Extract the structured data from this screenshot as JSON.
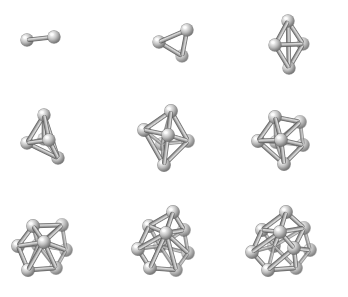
{
  "figure": {
    "background_color": "#ffffff",
    "grid": {
      "rows": 3,
      "cols": 3
    },
    "render_style": "ball-and-stick",
    "atom_color_highlight": "#f2f2f2",
    "atom_color_mid": "#b0b0b0",
    "atom_color_shadow": "#5a5a5a",
    "bond_color_light": "#c8c8c8",
    "bond_color_dark": "#707070",
    "bond_outline_color": "#4f4f4f"
  },
  "clusters": [
    {
      "id": "cluster-n2",
      "label": "N = 2",
      "atom_count": 2,
      "geometry": "dimer",
      "radius": 6.2,
      "atoms": [
        {
          "x": 27,
          "y": 40,
          "z": 0
        },
        {
          "x": 54,
          "y": 37,
          "z": 6
        }
      ],
      "bonds": [
        [
          0,
          1
        ]
      ]
    },
    {
      "id": "cluster-n3",
      "label": "N = 3",
      "atom_count": 3,
      "geometry": "triangle",
      "radius": 6.2,
      "atoms": [
        {
          "x": 43,
          "y": 42,
          "z": 2
        },
        {
          "x": 71,
          "y": 30,
          "z": 8
        },
        {
          "x": 66,
          "y": 56,
          "z": -2
        }
      ],
      "bonds": [
        [
          0,
          1
        ],
        [
          0,
          2
        ],
        [
          1,
          2
        ]
      ]
    },
    {
      "id": "cluster-n4",
      "label": "N = 4",
      "atom_count": 4,
      "geometry": "tetrahedron",
      "radius": 6.2,
      "atoms": [
        {
          "x": 56,
          "y": 21,
          "z": 4
        },
        {
          "x": 43,
          "y": 45,
          "z": 10
        },
        {
          "x": 71,
          "y": 44,
          "z": -2
        },
        {
          "x": 57,
          "y": 68,
          "z": 2
        }
      ],
      "bonds": [
        [
          0,
          1
        ],
        [
          0,
          2
        ],
        [
          1,
          2
        ],
        [
          1,
          3
        ],
        [
          2,
          3
        ],
        [
          0,
          3
        ]
      ]
    },
    {
      "id": "cluster-n5",
      "label": "N = 5",
      "atom_count": 5,
      "geometry": "trigonal-bipyramid",
      "radius": 6.2,
      "atoms": [
        {
          "x": 44,
          "y": 16,
          "z": 6
        },
        {
          "x": 27,
          "y": 44,
          "z": 2
        },
        {
          "x": 49,
          "y": 41,
          "z": 10
        },
        {
          "x": 58,
          "y": 59,
          "z": 0
        },
        {
          "x": 44,
          "y": 40,
          "z": -8
        }
      ],
      "bonds": [
        [
          0,
          1
        ],
        [
          0,
          2
        ],
        [
          0,
          4
        ],
        [
          1,
          2
        ],
        [
          1,
          4
        ],
        [
          2,
          3
        ],
        [
          2,
          4
        ],
        [
          3,
          4
        ],
        [
          0,
          3
        ],
        [
          1,
          3
        ]
      ]
    },
    {
      "id": "cluster-n6",
      "label": "N = 6",
      "atom_count": 6,
      "geometry": "octahedron",
      "radius": 6.4,
      "atoms": [
        {
          "x": 55,
          "y": 12,
          "z": 4
        },
        {
          "x": 28,
          "y": 31,
          "z": 2
        },
        {
          "x": 52,
          "y": 36,
          "z": 12
        },
        {
          "x": 72,
          "y": 42,
          "z": -2
        },
        {
          "x": 46,
          "y": 45,
          "z": -10
        },
        {
          "x": 48,
          "y": 66,
          "z": 2
        }
      ],
      "bonds": [
        [
          0,
          1
        ],
        [
          0,
          2
        ],
        [
          0,
          3
        ],
        [
          0,
          4
        ],
        [
          1,
          2
        ],
        [
          1,
          4
        ],
        [
          1,
          5
        ],
        [
          2,
          3
        ],
        [
          2,
          5
        ],
        [
          3,
          4
        ],
        [
          3,
          5
        ],
        [
          4,
          5
        ]
      ]
    },
    {
      "id": "cluster-n7",
      "label": "N = 7",
      "atom_count": 7,
      "geometry": "pentagonal-bipyramid",
      "radius": 6.4,
      "atoms": [
        {
          "x": 43,
          "y": 18,
          "z": 4
        },
        {
          "x": 68,
          "y": 23,
          "z": -2
        },
        {
          "x": 26,
          "y": 42,
          "z": 2
        },
        {
          "x": 49,
          "y": 41,
          "z": 12
        },
        {
          "x": 71,
          "y": 46,
          "z": -4
        },
        {
          "x": 44,
          "y": 43,
          "z": -12
        },
        {
          "x": 52,
          "y": 65,
          "z": 2
        }
      ],
      "bonds": [
        [
          0,
          1
        ],
        [
          0,
          2
        ],
        [
          0,
          3
        ],
        [
          0,
          5
        ],
        [
          1,
          3
        ],
        [
          1,
          4
        ],
        [
          1,
          5
        ],
        [
          2,
          3
        ],
        [
          2,
          5
        ],
        [
          2,
          6
        ],
        [
          3,
          4
        ],
        [
          3,
          6
        ],
        [
          4,
          5
        ],
        [
          4,
          6
        ],
        [
          5,
          6
        ]
      ]
    },
    {
      "id": "cluster-n8",
      "label": "N = 8",
      "atom_count": 8,
      "geometry": "bicapped-octahedron",
      "radius": 6.4,
      "atoms": [
        {
          "x": 33,
          "y": 28,
          "z": 4
        },
        {
          "x": 62,
          "y": 27,
          "z": -2
        },
        {
          "x": 18,
          "y": 48,
          "z": 0
        },
        {
          "x": 44,
          "y": 44,
          "z": 12
        },
        {
          "x": 66,
          "y": 52,
          "z": -4
        },
        {
          "x": 38,
          "y": 47,
          "z": -12
        },
        {
          "x": 28,
          "y": 72,
          "z": 2
        },
        {
          "x": 56,
          "y": 70,
          "z": -2
        }
      ],
      "bonds": [
        [
          0,
          1
        ],
        [
          0,
          2
        ],
        [
          0,
          3
        ],
        [
          0,
          5
        ],
        [
          1,
          3
        ],
        [
          1,
          4
        ],
        [
          1,
          5
        ],
        [
          2,
          3
        ],
        [
          2,
          5
        ],
        [
          2,
          6
        ],
        [
          3,
          4
        ],
        [
          3,
          6
        ],
        [
          3,
          7
        ],
        [
          4,
          5
        ],
        [
          4,
          7
        ],
        [
          5,
          6
        ],
        [
          5,
          7
        ],
        [
          6,
          7
        ]
      ]
    },
    {
      "id": "cluster-n9",
      "label": "N = 9",
      "atom_count": 9,
      "geometry": "tricapped-trigonal-prism",
      "radius": 6.4,
      "atoms": [
        {
          "x": 57,
          "y": 14,
          "z": 4
        },
        {
          "x": 33,
          "y": 28,
          "z": 0
        },
        {
          "x": 68,
          "y": 32,
          "z": -4
        },
        {
          "x": 50,
          "y": 35,
          "z": 12
        },
        {
          "x": 22,
          "y": 51,
          "z": 2
        },
        {
          "x": 72,
          "y": 55,
          "z": -6
        },
        {
          "x": 44,
          "y": 48,
          "z": -12
        },
        {
          "x": 34,
          "y": 70,
          "z": 2
        },
        {
          "x": 60,
          "y": 72,
          "z": -2
        }
      ],
      "bonds": [
        [
          0,
          1
        ],
        [
          0,
          2
        ],
        [
          0,
          3
        ],
        [
          0,
          6
        ],
        [
          1,
          3
        ],
        [
          1,
          4
        ],
        [
          1,
          6
        ],
        [
          2,
          3
        ],
        [
          2,
          5
        ],
        [
          2,
          6
        ],
        [
          3,
          4
        ],
        [
          3,
          5
        ],
        [
          3,
          7
        ],
        [
          3,
          8
        ],
        [
          4,
          6
        ],
        [
          4,
          7
        ],
        [
          5,
          6
        ],
        [
          5,
          8
        ],
        [
          6,
          7
        ],
        [
          6,
          8
        ],
        [
          7,
          8
        ]
      ]
    },
    {
      "id": "cluster-n10",
      "label": "N = 10",
      "atom_count": 10,
      "geometry": "bicapped-square-antiprism",
      "radius": 6.4,
      "atoms": [
        {
          "x": 54,
          "y": 14,
          "z": 4
        },
        {
          "x": 30,
          "y": 32,
          "z": 0
        },
        {
          "x": 72,
          "y": 30,
          "z": -4
        },
        {
          "x": 48,
          "y": 34,
          "z": 12
        },
        {
          "x": 20,
          "y": 54,
          "z": 2
        },
        {
          "x": 78,
          "y": 52,
          "z": -6
        },
        {
          "x": 42,
          "y": 48,
          "z": -12
        },
        {
          "x": 62,
          "y": 50,
          "z": 8
        },
        {
          "x": 36,
          "y": 72,
          "z": 2
        },
        {
          "x": 64,
          "y": 70,
          "z": -2
        }
      ],
      "bonds": [
        [
          0,
          1
        ],
        [
          0,
          2
        ],
        [
          0,
          3
        ],
        [
          0,
          6
        ],
        [
          1,
          3
        ],
        [
          1,
          4
        ],
        [
          1,
          6
        ],
        [
          2,
          3
        ],
        [
          2,
          5
        ],
        [
          2,
          7
        ],
        [
          3,
          4
        ],
        [
          3,
          7
        ],
        [
          4,
          6
        ],
        [
          4,
          8
        ],
        [
          5,
          7
        ],
        [
          5,
          9
        ],
        [
          6,
          8
        ],
        [
          6,
          9
        ],
        [
          7,
          9
        ],
        [
          8,
          9
        ],
        [
          3,
          6
        ],
        [
          2,
          6
        ],
        [
          7,
          8
        ]
      ]
    }
  ]
}
